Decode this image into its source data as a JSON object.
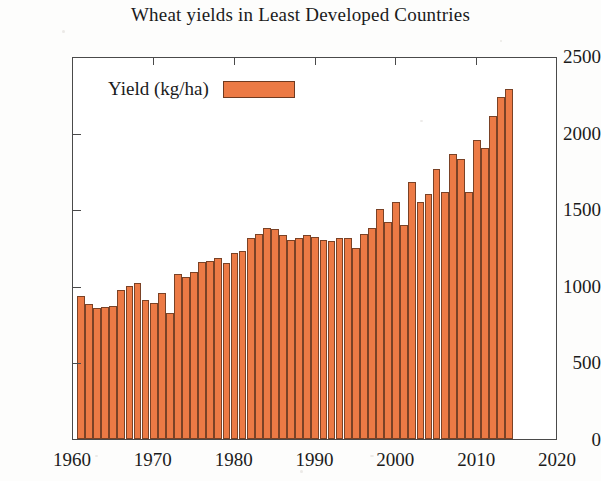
{
  "chart_data": {
    "type": "bar",
    "title": "Wheat yields in Least Developed Countries",
    "xlabel": "",
    "ylabel": "",
    "ylim": [
      0,
      2500
    ],
    "xlim": [
      1960,
      2020
    ],
    "ytick_labels": [
      "0",
      "500",
      "1000",
      "1500",
      "2000",
      "2500"
    ],
    "ytick_values": [
      0,
      500,
      1000,
      1500,
      2000,
      2500
    ],
    "xtick_labels": [
      "1960",
      "1970",
      "1980",
      "1990",
      "2000",
      "2010",
      "2020"
    ],
    "xtick_values": [
      1960,
      1970,
      1980,
      1990,
      2000,
      2010,
      2020
    ],
    "grid": false,
    "legend": {
      "position": "top-left-inside",
      "entries": [
        {
          "name": "Yield (kg/ha)",
          "color": "#ec7a45"
        }
      ]
    },
    "series": [
      {
        "name": "Yield (kg/ha)",
        "color": "#ec7a45",
        "x": [
          1961,
          1962,
          1963,
          1964,
          1965,
          1966,
          1967,
          1968,
          1969,
          1970,
          1971,
          1972,
          1973,
          1974,
          1975,
          1976,
          1977,
          1978,
          1979,
          1980,
          1981,
          1982,
          1983,
          1984,
          1985,
          1986,
          1987,
          1988,
          1989,
          1990,
          1991,
          1992,
          1993,
          1994,
          1995,
          1996,
          1997,
          1998,
          1999,
          2000,
          2001,
          2002,
          2003,
          2004,
          2005,
          2006,
          2007,
          2008,
          2009,
          2010,
          2011,
          2012,
          2013,
          2014
        ],
        "values": [
          935,
          880,
          855,
          860,
          865,
          975,
          1000,
          1020,
          905,
          890,
          955,
          820,
          1080,
          1060,
          1090,
          1155,
          1165,
          1180,
          1150,
          1215,
          1225,
          1310,
          1335,
          1375,
          1370,
          1330,
          1300,
          1310,
          1330,
          1320,
          1300,
          1290,
          1310,
          1315,
          1250,
          1335,
          1380,
          1500,
          1415,
          1545,
          1395,
          1680,
          1545,
          1600,
          1760,
          1610,
          1860,
          1825,
          1615,
          1950,
          1900,
          2110,
          2230,
          2285
        ]
      }
    ]
  }
}
